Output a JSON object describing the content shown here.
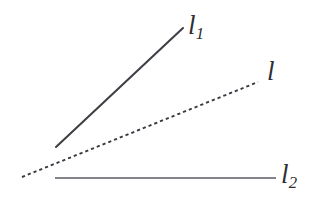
{
  "figure": {
    "type": "geometry-line-diagram",
    "background_color": "#ffffff",
    "width": 319,
    "height": 202,
    "labels": {
      "l1": {
        "base": "l",
        "subscript": "1"
      },
      "l": {
        "base": "l",
        "subscript": ""
      },
      "l2": {
        "base": "l",
        "subscript": "2"
      }
    },
    "elements": [
      {
        "name": "line-l1",
        "label": "l1",
        "style": "solid",
        "color": "#3f3f46",
        "stroke_width": 2.1,
        "x1": 56,
        "y1": 147,
        "x2": 183,
        "y2": 28
      },
      {
        "name": "line-l",
        "label": "l",
        "style": "dotted",
        "color": "#3a3a42",
        "stroke_width": 1.9,
        "dash": "3.2 3.0",
        "x1": 22,
        "y1": 177,
        "x2": 258,
        "y2": 82
      },
      {
        "name": "line-l2",
        "label": "l2",
        "style": "solid",
        "color": "#5a5a62",
        "stroke_width": 1.5,
        "x1": 55,
        "y1": 178,
        "x2": 276,
        "y2": 178
      }
    ]
  }
}
